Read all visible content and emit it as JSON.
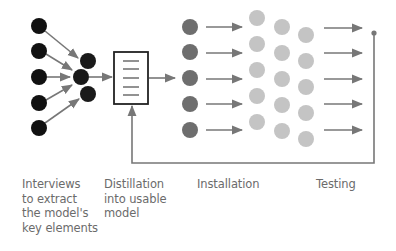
{
  "diagram": {
    "colors": {
      "interview_nodes": "#111111",
      "installation_nodes": "#6e6e6e",
      "testing_nodes": "#c4c4c4",
      "arrows": "#777777",
      "box_border": "#222222",
      "label_text": "#6b6b6b"
    },
    "stages": [
      {
        "id": "interviews",
        "label": "Interviews\nto extract\nthe model's\nkey elements"
      },
      {
        "id": "distillation",
        "label": "Distillation\ninto usable\nmodel"
      },
      {
        "id": "installation",
        "label": "Installation"
      },
      {
        "id": "testing",
        "label": "Testing"
      }
    ],
    "nodes": {
      "interview_sources": [
        [
          39,
          26
        ],
        [
          39,
          51
        ],
        [
          39,
          77
        ],
        [
          39,
          103
        ],
        [
          39,
          128
        ]
      ],
      "interview_cluster": [
        [
          87,
          61
        ],
        [
          80,
          77
        ],
        [
          87,
          95
        ]
      ],
      "installation": [
        [
          190,
          27
        ],
        [
          190,
          52
        ],
        [
          190,
          78
        ],
        [
          190,
          104
        ],
        [
          190,
          130
        ]
      ],
      "testing_col1": [
        [
          257,
          18
        ],
        [
          257,
          44
        ],
        [
          257,
          70
        ],
        [
          257,
          96
        ],
        [
          257,
          122
        ]
      ],
      "testing_col2": [
        [
          282,
          27
        ],
        [
          282,
          53
        ],
        [
          282,
          79
        ],
        [
          282,
          105
        ],
        [
          282,
          131
        ]
      ],
      "testing_col3": [
        [
          306,
          35
        ],
        [
          306,
          61
        ],
        [
          306,
          87
        ],
        [
          306,
          113
        ],
        [
          306,
          139
        ]
      ]
    },
    "feedback_loop": "Testing results feed back into the distillation model"
  }
}
